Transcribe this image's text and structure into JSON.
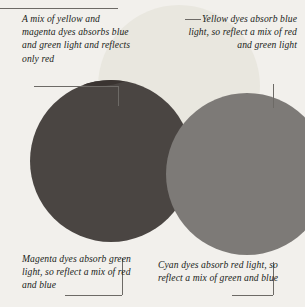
{
  "figure": {
    "background_color": "#f2f0ec"
  },
  "diagram": {
    "type": "venn-three-circle",
    "circles": [
      {
        "name": "yellow",
        "label": "Yellow dyes",
        "color": "#e9e7df",
        "cx": 179,
        "cy": 86,
        "r": 81
      },
      {
        "name": "magenta",
        "label": "Magenta dyes",
        "color": "#4a4542",
        "cx": 111,
        "cy": 161,
        "r": 81
      },
      {
        "name": "cyan",
        "label": "Cyan dyes",
        "color": "#7d7a77",
        "cx": 247,
        "cy": 174,
        "r": 81
      }
    ],
    "overlaps": [
      {
        "name": "yellow-magenta",
        "result": "red",
        "color": "#3a3431"
      },
      {
        "name": "yellow-cyan",
        "result": "green",
        "color": "#6f6c69"
      },
      {
        "name": "magenta-cyan",
        "result": "blue",
        "color": "#45413f"
      },
      {
        "name": "all-three",
        "result": "black",
        "color": "#0a0908"
      }
    ]
  },
  "captions": {
    "red": "A mix of yellow and magenta dyes absorbs blue and green light and reflects only red",
    "yellow": "Yellow dyes absorb blue light, so reflect a mix of red and green light",
    "magenta": "Magenta dyes absorb green light, so reflect a mix of red and blue",
    "cyan": "Cyan dyes absorb red light, so reflect a mix of green and blue"
  },
  "leader_lines": {
    "line_color": "#6d6a66"
  }
}
